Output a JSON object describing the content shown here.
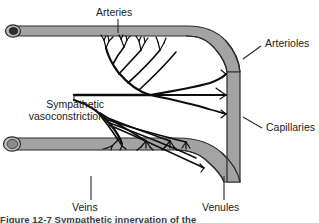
{
  "figure": {
    "labels": {
      "arteries": "Arteries",
      "arterioles": "Arterioles",
      "capillaries": "Capillaries",
      "venules": "Venules",
      "veins": "Veins",
      "sympathetic_line1": "Sympathetic",
      "sympathetic_line2": "vasoconstriction"
    },
    "caption": "Figure 12-7  Sympathetic innervation of the",
    "colors": {
      "vessel_fill": "#a3a3a3",
      "vessel_outline": "#2b2b2b",
      "artery_lumen": "#2e2e2e",
      "vein_lumen": "#8a8a8a",
      "nerve": "#0d0d0d",
      "leader_line": "#2b2b2b",
      "text": "#1a1a1a",
      "background": "#ffffff"
    }
  }
}
